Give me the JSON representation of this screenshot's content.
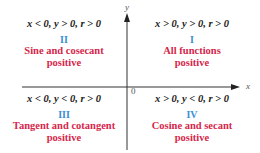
{
  "colors": {
    "numeral": "#3a8fd6",
    "description": "#d6264b",
    "axis": "#333333",
    "condition": "#222222"
  },
  "axes": {
    "x_label": "x",
    "y_label": "y",
    "origin_label": "0"
  },
  "quadrants": [
    {
      "id": "II",
      "condition": "x < 0, y > 0, r > 0",
      "numeral": "II",
      "description_line1": "Sine and cosecant",
      "description_line2": "positive"
    },
    {
      "id": "I",
      "condition": "x > 0, y > 0, r > 0",
      "numeral": "I",
      "description_line1": "All functions",
      "description_line2": "positive"
    },
    {
      "id": "III",
      "condition": "x < 0, y < 0, r > 0",
      "numeral": "III",
      "description_line1": "Tangent and cotangent",
      "description_line2": "positive"
    },
    {
      "id": "IV",
      "condition": "x > 0, y < 0, r > 0",
      "numeral": "IV",
      "description_line1": "Cosine and secant",
      "description_line2": "positive"
    }
  ]
}
